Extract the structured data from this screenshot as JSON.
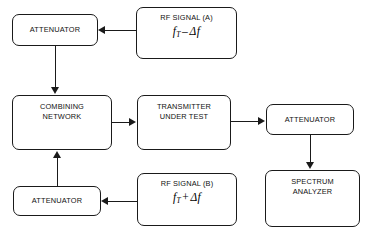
{
  "diagram": {
    "type": "block-diagram",
    "background_color": "#ffffff",
    "line_color": "#1a1a1a",
    "text_color": "#111111",
    "caption": ""
  },
  "nodes": {
    "attenuator_top": {
      "label": "ATTENUATOR"
    },
    "rf_signal_a": {
      "label": "RF SIGNAL (A)",
      "formula": {
        "symbol": "f",
        "subscript": "T",
        "operator": "–",
        "delta": "Δf"
      }
    },
    "combining_network": {
      "label": "COMBINING\nNETWORK"
    },
    "transmitter": {
      "label": "TRANSMITTER\nUNDER TEST"
    },
    "attenuator_right": {
      "label": "ATTENUATOR"
    },
    "attenuator_bottom": {
      "label": "ATTENUATOR"
    },
    "rf_signal_b": {
      "label": "RF SIGNAL (B)",
      "formula": {
        "symbol": "f",
        "subscript": "T",
        "operator": "+",
        "delta": "Δf"
      }
    },
    "spectrum_analyzer": {
      "label": "SPECTRUM\nANALYZER"
    }
  },
  "edges": [
    {
      "from": "rf_signal_a",
      "to": "attenuator_top",
      "direction": "left"
    },
    {
      "from": "attenuator_top",
      "to": "combining_network",
      "direction": "down"
    },
    {
      "from": "combining_network",
      "to": "transmitter",
      "direction": "right"
    },
    {
      "from": "transmitter",
      "to": "attenuator_right",
      "direction": "right"
    },
    {
      "from": "attenuator_right",
      "to": "spectrum_analyzer",
      "direction": "down"
    },
    {
      "from": "rf_signal_b",
      "to": "attenuator_bottom",
      "direction": "left"
    },
    {
      "from": "attenuator_bottom",
      "to": "combining_network",
      "direction": "up"
    }
  ]
}
